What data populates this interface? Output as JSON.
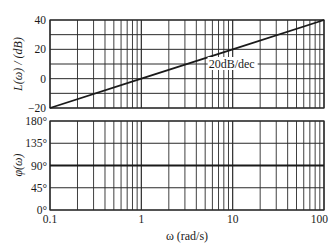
{
  "chart_data": [
    {
      "type": "line",
      "title": "",
      "panel": "magnitude",
      "xlabel": "ω (rad/s)",
      "ylabel": "L(ω) / (dB)",
      "xscale": "log",
      "xlim": [
        0.1,
        100
      ],
      "ylim": [
        -20,
        40
      ],
      "yticks": [
        -20,
        0,
        20,
        40
      ],
      "ytick_labels": [
        "−20",
        "0",
        "20",
        "40"
      ],
      "ygrid_step": 10,
      "grid": true,
      "series": [
        {
          "name": "L(ω)",
          "x": [
            0.1,
            1,
            10,
            100
          ],
          "y": [
            -20,
            0,
            20,
            40
          ]
        }
      ],
      "annotations": [
        {
          "text": "20dB/dec",
          "x": 10,
          "y": 10
        }
      ]
    },
    {
      "type": "line",
      "title": "",
      "panel": "phase",
      "xlabel": "ω (rad/s)",
      "ylabel": "φ(ω)",
      "xscale": "log",
      "xlim": [
        0.1,
        100
      ],
      "ylim": [
        0,
        180
      ],
      "yticks": [
        0,
        45,
        90,
        135,
        180
      ],
      "ytick_labels": [
        "0°",
        "45°",
        "90°",
        "135°",
        "180°"
      ],
      "xticks": [
        0.1,
        1,
        10,
        100
      ],
      "xtick_labels": [
        "0.1",
        "1",
        "10",
        "100"
      ],
      "grid": true,
      "series": [
        {
          "name": "φ(ω)",
          "x": [
            0.1,
            100
          ],
          "y": [
            90,
            90
          ]
        }
      ]
    }
  ],
  "labels": {
    "mag_ylabel": "L(ω) / (dB)",
    "phase_ylabel": "φ(ω)",
    "xlabel": "ω (rad/s)",
    "slope_annotation": "20dB/dec"
  },
  "colors": {
    "line": "#1a1a1a",
    "grid": "#2a2a2a",
    "background": "#ffffff"
  }
}
